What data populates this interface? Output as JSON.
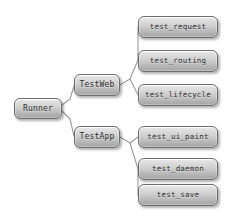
{
  "diagram": {
    "background_color": "#ffffff",
    "node_fill_top": "#ececed",
    "node_fill_bottom": "#a2a2a3",
    "node_border_color": "#6d6d6d",
    "node_text_color": "#2b2b2b",
    "edge_color": "#9a9a9a",
    "root": {
      "id": "runner",
      "label": "Runner"
    },
    "branches": [
      {
        "id": "testweb",
        "label": "TestWeb",
        "leaves": [
          {
            "id": "test_request",
            "label": "test_request"
          },
          {
            "id": "test_routing",
            "label": "test_routing"
          },
          {
            "id": "test_lifecycle",
            "label": "test_lifecycle"
          }
        ]
      },
      {
        "id": "testapp",
        "label": "TestApp",
        "leaves": [
          {
            "id": "test_ui_paint",
            "label": "test_ui_paint"
          },
          {
            "id": "test_daemon",
            "label": "test_daemon"
          },
          {
            "id": "test_save",
            "label": "test_save"
          }
        ]
      }
    ]
  }
}
